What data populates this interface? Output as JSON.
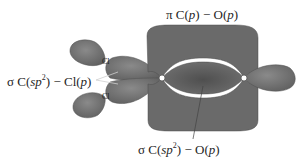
{
  "diagram": {
    "colors": {
      "orbital_fill": "#6e6e6e",
      "orbital_dark": "#555555",
      "orbital_light": "#8a8a8a",
      "background": "#ffffff",
      "text": "#1f1f1f"
    },
    "labels": {
      "pi_bond": {
        "prefix": "π C(",
        "p1": "p",
        "mid": ") − O(",
        "p2": "p",
        "suffix": ")"
      },
      "sigma_c_cl": {
        "prefix": "σ C(",
        "orb": "sp",
        "sup": "2",
        "mid": ") − Cl(",
        "p": "p",
        "suffix": ")"
      },
      "sigma_c_o": {
        "prefix": "σ C(",
        "orb": "sp",
        "sup": "2",
        "mid": ") − O(",
        "p": "p",
        "suffix": ")"
      }
    },
    "atoms": {
      "carbon": "C",
      "oxygen": "O",
      "chlorine_top": "Cl",
      "chlorine_bottom": "Cl"
    }
  }
}
